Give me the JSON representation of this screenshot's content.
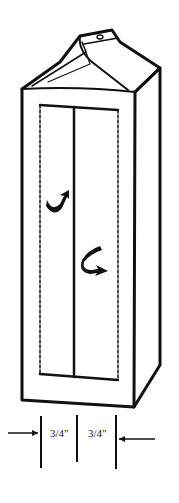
{
  "diagram": {
    "dimensions": [
      {
        "label": "3/4\"",
        "position": "left"
      },
      {
        "label": "3/4\"",
        "position": "right"
      }
    ],
    "arrows": [
      "curved-arrow-up",
      "curved-arrow-down"
    ],
    "colors": {
      "ink": "#111111",
      "background": "#ffffff"
    }
  }
}
